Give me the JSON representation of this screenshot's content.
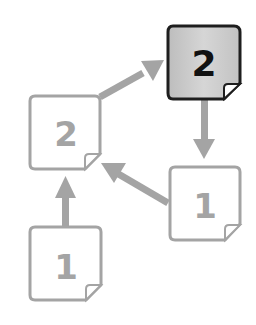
{
  "diagram": {
    "nodes": [
      {
        "id": "top-right",
        "label": "2",
        "highlighted": true
      },
      {
        "id": "middle-left",
        "label": "2",
        "highlighted": false
      },
      {
        "id": "middle-right",
        "label": "1",
        "highlighted": false
      },
      {
        "id": "bottom-left",
        "label": "1",
        "highlighted": false
      }
    ],
    "edges": [
      {
        "from": "bottom-left",
        "to": "middle-left"
      },
      {
        "from": "middle-right",
        "to": "middle-left"
      },
      {
        "from": "middle-left",
        "to": "top-right"
      },
      {
        "from": "top-right",
        "to": "middle-right"
      }
    ],
    "colors": {
      "muted": "#a4a4a4",
      "highlight_border": "#1e1e1e",
      "highlight_fill": "#c8c8c8",
      "highlight_text": "#111111",
      "background": "#ffffff"
    }
  }
}
